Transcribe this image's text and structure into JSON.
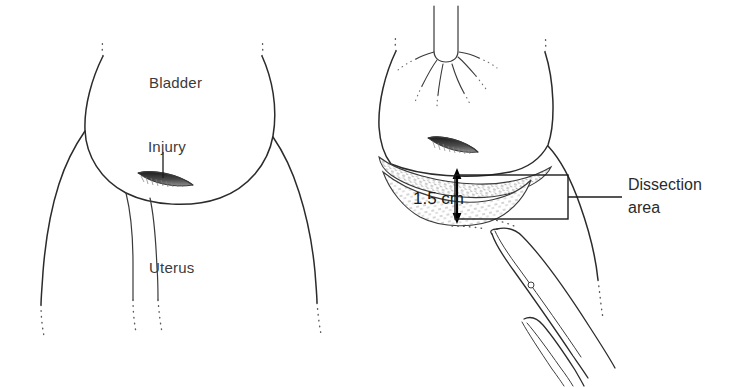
{
  "figure": {
    "background_color": "#ffffff",
    "ink_color": "#2b2b2b",
    "width": 747,
    "height": 387
  },
  "panels": [
    {
      "id": "left-panel",
      "name": "injury-panel",
      "labels": {
        "bladder": "Bladder",
        "injury": "Injury",
        "uterus": "Uterus"
      }
    },
    {
      "id": "right-panel",
      "name": "dissection-panel",
      "labels": {
        "dimension": "1.5 cm",
        "dissection_line1": "Dissection",
        "dissection_line2": "area"
      }
    }
  ],
  "labels": {
    "bladder": "Bladder",
    "injury": "Injury",
    "uterus": "Uterus",
    "dimension": "1.5 cm",
    "dissection_line1": "Dissection",
    "dissection_line2": "area"
  },
  "icons": {
    "injury_slit": "injury-slit-icon",
    "dimension_arrow": "double-headed-arrow-icon",
    "scissors": "surgical-scissors-icon",
    "callout_box": "callout-rectangle-icon"
  }
}
